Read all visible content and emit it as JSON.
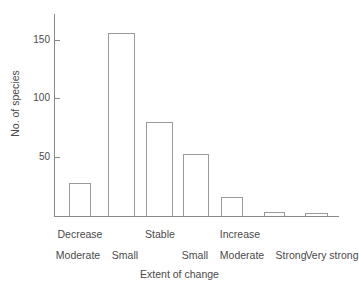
{
  "chart_data": {
    "type": "bar",
    "title": "",
    "subtitle": "",
    "xlabel": "Extent of change",
    "ylabel": "No. of species",
    "categories": [
      "Decrease - Moderate",
      "Decrease - Small",
      "Stable",
      "Increase - Small",
      "Increase - Moderate",
      "Increase - Strong",
      "Increase - Very strong"
    ],
    "values": [
      28,
      156,
      80,
      53,
      16,
      3,
      2
    ],
    "ylim": [
      0,
      175
    ],
    "yticks": [
      50,
      100,
      150
    ],
    "ytick_labels": [
      "50",
      "100",
      "150"
    ],
    "grid": false,
    "legend": false,
    "legend_position": "none",
    "bar_style": {
      "fill": "#ffffff",
      "edge": "#9a9a9a"
    },
    "group_labels": [
      {
        "text": "Decrease",
        "center_bars": [
          0,
          1
        ]
      },
      {
        "text": "Stable",
        "center_bars": [
          2
        ]
      },
      {
        "text": "Increase",
        "center_bars": [
          3,
          4,
          5,
          6
        ]
      }
    ],
    "sub_labels": [
      "Moderate",
      "Small",
      "",
      "Small",
      "Moderate",
      "Strong",
      "Very strong"
    ]
  },
  "axis": {
    "y_title": "No. of species",
    "x_title": "Extent of change",
    "ticks": [
      {
        "label": "150",
        "value": 150
      },
      {
        "label": "100",
        "value": 100
      },
      {
        "label": "50",
        "value": 50
      }
    ]
  },
  "tier1": {
    "decrease": "Decrease",
    "stable": "Stable",
    "increase": "Increase"
  },
  "tier2": {
    "moderate_dec": "Moderate",
    "small_dec": "Small",
    "small_inc": "Small",
    "moderate_inc": "Moderate",
    "strong_inc": "Strong",
    "very_strong_inc": "Very strong"
  },
  "colors": {
    "axis": "#8a8a8a",
    "bar_edge": "#9a9a9a",
    "bar_fill": "#ffffff",
    "text": "#4a4a4a",
    "background": "#ffffff"
  }
}
